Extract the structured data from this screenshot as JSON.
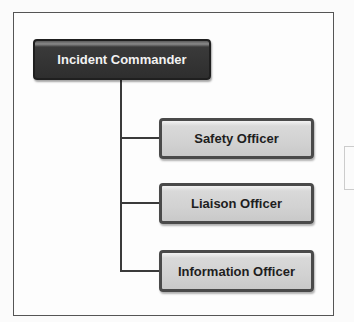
{
  "diagram": {
    "type": "org-chart",
    "root": {
      "label": "Incident Commander",
      "color": "#2e2e2e"
    },
    "children": [
      {
        "label": "Safety Officer",
        "color": "#d2d2d2"
      },
      {
        "label": "Liaison Officer",
        "color": "#d2d2d2"
      },
      {
        "label": "Information Officer",
        "color": "#d2d2d2"
      }
    ]
  }
}
